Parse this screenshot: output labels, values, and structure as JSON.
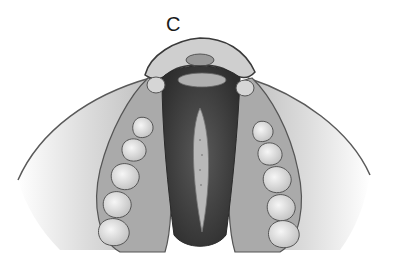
{
  "figure": {
    "panel_label": "C",
    "colors": {
      "background": "#ffffff",
      "outline": "#4a4a4a",
      "soft_tissue": "#c8c8c8",
      "gum": "#a8a8a8",
      "cleft_dark": "#3c3c3c",
      "cleft_inner": "#b9b9b9",
      "teeth": "#e8e8e8"
    }
  }
}
